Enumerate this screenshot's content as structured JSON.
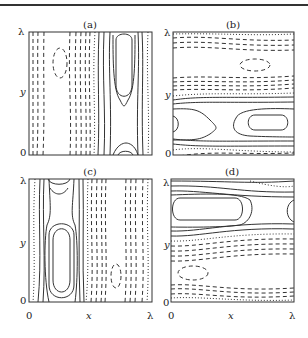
{
  "figure": {
    "panels": [
      {
        "id": "a",
        "title": "(a)",
        "y_top": "λ",
        "y_mid": "y",
        "y_bottom": "0",
        "orientation": "vertical",
        "solid_region": "right",
        "dashed_region": "left"
      },
      {
        "id": "b",
        "title": "(b)",
        "y_top": "λ",
        "y_mid": "y",
        "y_bottom": "0",
        "orientation": "horizontal",
        "solid_region": "bottom",
        "dashed_region": "top"
      },
      {
        "id": "c",
        "title": "(c)",
        "y_top": "λ",
        "y_mid": "y",
        "y_bottom": "0",
        "x_left": "0",
        "x_mid": "x",
        "x_right": "λ",
        "orientation": "vertical",
        "solid_region": "left",
        "dashed_region": "right"
      },
      {
        "id": "d",
        "title": "(d)",
        "y_top": "λ",
        "y_mid": "y",
        "y_bottom": "0",
        "x_left": "0",
        "x_mid": "x",
        "x_right": "λ",
        "orientation": "horizontal",
        "solid_region": "top",
        "dashed_region": "bottom"
      }
    ],
    "legend_styles": {
      "positive": "solid",
      "negative": "dashed",
      "zero": "dotted"
    },
    "colors": {
      "ink": "#333333",
      "background": "#ffffff"
    }
  }
}
